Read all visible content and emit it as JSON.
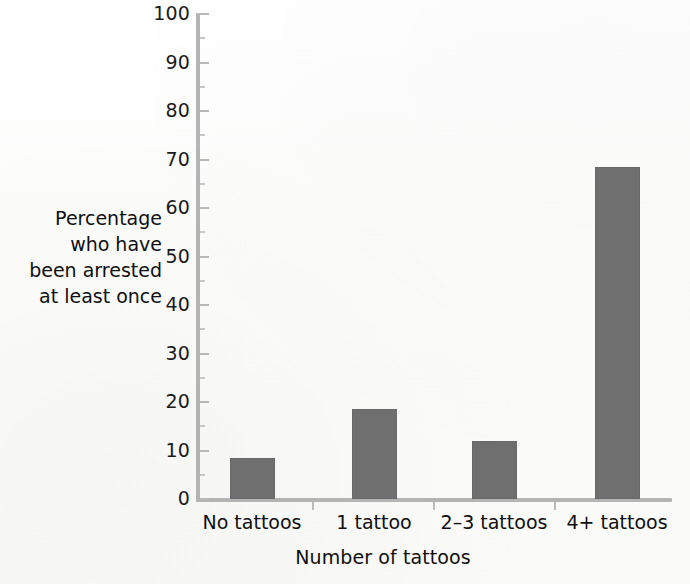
{
  "chart_data": {
    "type": "bar",
    "title": "",
    "subtitle": "",
    "xlabel": "Number of tattoos",
    "ylabel": "Percentage who have been arrested at least once",
    "ylabel_lines": [
      "Percentage",
      "who have",
      "been arrested",
      "at least once"
    ],
    "categories": [
      "No tattoos",
      "1 tattoo",
      "2–3 tattoos",
      "4+ tattoos"
    ],
    "values": [
      8.5,
      18.5,
      12,
      68.5
    ],
    "ylim": [
      0,
      100
    ],
    "xlim_note": "categorical",
    "y_ticks": [
      0,
      10,
      20,
      30,
      40,
      50,
      60,
      70,
      80,
      90,
      100
    ],
    "y_tick_labels": [
      "0",
      "10",
      "20",
      "30",
      "40",
      "50",
      "60",
      "70",
      "80",
      "90",
      "100"
    ],
    "y_minor_ticks": [
      5,
      15,
      25,
      35,
      45,
      55,
      65,
      75,
      85,
      95
    ],
    "grid": false,
    "legend": "none",
    "legend_position": "none",
    "series": [
      {
        "name": "Percentage who have been arrested at least once",
        "values": [
          8.5,
          18.5,
          12,
          68.5
        ]
      }
    ],
    "annotations": []
  },
  "style": {
    "bar_color": "#6f6f6f",
    "axis_color": "#b4b4b4",
    "tick_color": "#b8b8b8",
    "text_color": "#0f0f0f",
    "background_color": "#fdfdfc"
  }
}
